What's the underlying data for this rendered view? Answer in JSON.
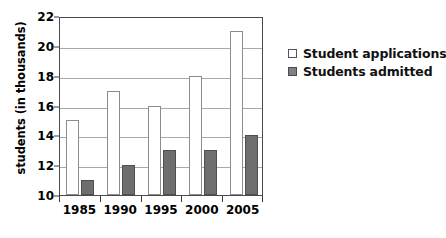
{
  "chart_data": {
    "type": "bar",
    "title": "",
    "xlabel": "",
    "ylabel": "students (in thousands)",
    "categories": [
      "1985",
      "1990",
      "1995",
      "2000",
      "2005"
    ],
    "series": [
      {
        "name": "Student applications",
        "values": [
          15,
          17,
          16,
          18,
          21
        ],
        "color": "#ffffff",
        "border_color": "#8c8c8c"
      },
      {
        "name": "Students admitted",
        "values": [
          11,
          12,
          13,
          13,
          14
        ],
        "color": "#6e6e6e",
        "border_color": "#4f4f4f"
      }
    ],
    "ylim": [
      10,
      22
    ],
    "ytick_step": 2,
    "yticks": [
      10,
      12,
      14,
      16,
      18,
      20,
      22
    ],
    "ytick_labels": [
      "10",
      "12",
      "14",
      "16",
      "18",
      "20",
      "22"
    ],
    "grid": true,
    "grid_color": "#a8a8a8",
    "legend_position": "right",
    "frame_color": "#4a4a4a",
    "background": "#ffffff"
  }
}
